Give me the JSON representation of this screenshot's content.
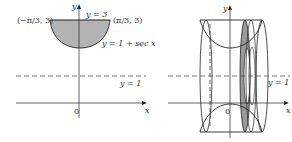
{
  "left_panel": {
    "y_axis_label": "y",
    "x_axis_label": "x",
    "origin_label": "0",
    "top_line_label": "y = 3",
    "left_point_label": "(−π/3, 3)",
    "right_point_label": "(π/3, 3)",
    "curve_label": "y = 1 + sec x",
    "dashed_line_label": "y = 1"
  },
  "right_panel": {
    "y_axis_label": "y",
    "x_axis_label": "x",
    "origin_label": "0",
    "dashed_line_label": "y = 1"
  },
  "colors": {
    "stroke": "#222222",
    "shade": "#b3b3b3",
    "washer_shade": "#9a9a9a",
    "dashed": "#555555"
  }
}
